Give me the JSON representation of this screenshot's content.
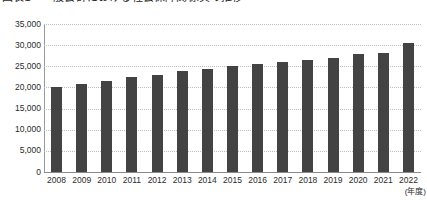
{
  "title": {
    "text": "図表1　一般会計における社会保障関係費の推移"
  },
  "axis_unit_label": "(年度)",
  "chart_data": {
    "type": "bar",
    "title": "図表1　一般会計における社会保障関係費の推移",
    "xlabel": "(年度)",
    "ylabel": "",
    "ylim": [
      0,
      35000
    ],
    "ytick_step": 5000,
    "grid": true,
    "legend": false,
    "bar_color": "#434343",
    "grid_color": "#bdbdbd",
    "categories": [
      "2008",
      "2009",
      "2010",
      "2011",
      "2012",
      "2013",
      "2014",
      "2015",
      "2016",
      "2017",
      "2018",
      "2019",
      "2020",
      "2021",
      "2022"
    ],
    "ytick_labels": [
      "0",
      "5,000",
      "10,000",
      "15,000",
      "20,000",
      "25,000",
      "30,000",
      "35,000"
    ],
    "ytick_values": [
      0,
      5000,
      10000,
      15000,
      20000,
      25000,
      30000,
      35000
    ],
    "values": [
      20100,
      20900,
      21600,
      22400,
      23000,
      23800,
      24300,
      25100,
      25500,
      26100,
      26400,
      26900,
      27800,
      28200,
      30500
    ]
  }
}
